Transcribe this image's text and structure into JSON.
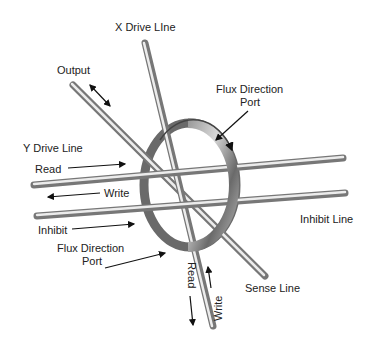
{
  "diagram": {
    "type": "core-memory-wiring",
    "labels": {
      "x_drive_line": "X Drive LIne",
      "output": "Output",
      "flux_direction_top_line1": "Flux Direction",
      "flux_direction_top_line2": "Port",
      "y_drive_line": "Y Drive Line",
      "read_left": "Read",
      "write_left": "Write",
      "inhibit": "Inhibit",
      "flux_direction_bottom_line1": "Flux Direction",
      "flux_direction_bottom_line2": "Port",
      "inhibit_line": "Inhibit Line",
      "sense_line": "Sense Line",
      "read_bottom": "Read",
      "write_bottom": "Write"
    },
    "colors": {
      "rod_dark": "#7a7a7a",
      "rod_light": "#e8e8e8",
      "ring_dark": "#5a5a5a",
      "ring_light": "#cfcfcf",
      "text": "#222222",
      "arrow": "#111111"
    }
  }
}
